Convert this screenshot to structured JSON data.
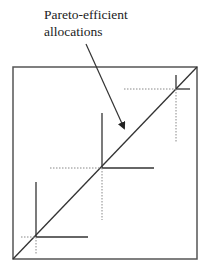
{
  "diagram": {
    "type": "edgeworth-box",
    "annotation": {
      "lines": [
        "Pareto-efficient",
        "allocations"
      ]
    },
    "colors": {
      "solid": "#333333",
      "dotted": "#888888",
      "box": "#555555"
    },
    "box": {
      "x1": 13,
      "y1": 67,
      "x2": 197,
      "y2": 259
    },
    "contract_curve": {
      "from": [
        13,
        259
      ],
      "to": [
        197,
        67
      ]
    },
    "arrow": {
      "from": [
        86,
        44
      ],
      "to": [
        124,
        128
      ]
    },
    "tangency_points": [
      {
        "name": "low",
        "cx": 36,
        "cy": 237,
        "vert_solid_top": 182,
        "horiz_solid_right": 88,
        "horiz_dotted_left": 21,
        "vert_dotted_bottom": 254
      },
      {
        "name": "mid",
        "cx": 102,
        "cy": 168,
        "vert_solid_top": 113,
        "horiz_solid_right": 154,
        "horiz_dotted_left": 50,
        "vert_dotted_bottom": 220
      },
      {
        "name": "high",
        "cx": 176,
        "cy": 89,
        "vert_solid_top": 75,
        "horiz_solid_right": 190,
        "horiz_dotted_left": 124,
        "vert_dotted_bottom": 143
      }
    ]
  }
}
